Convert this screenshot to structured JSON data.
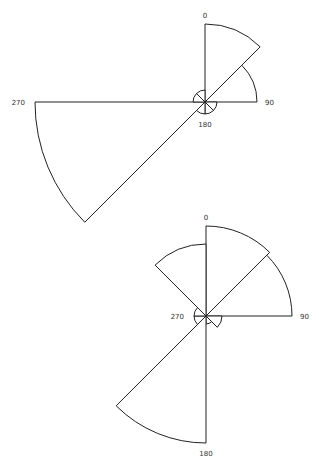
{
  "chart_data": [
    {
      "type": "polar-bar",
      "title": "",
      "center": [
        205,
        102
      ],
      "angle_labels": [
        "0",
        "90",
        "180",
        "270"
      ],
      "sectors": [
        {
          "start": 0,
          "end": 45,
          "r": 78
        },
        {
          "start": 45,
          "end": 90,
          "r": 52
        },
        {
          "start": 90,
          "end": 135,
          "r": 12
        },
        {
          "start": 135,
          "end": 180,
          "r": 12
        },
        {
          "start": 180,
          "end": 225,
          "r": 12
        },
        {
          "start": 225,
          "end": 270,
          "r": 170
        },
        {
          "start": 270,
          "end": 315,
          "r": 12
        },
        {
          "start": 315,
          "end": 360,
          "r": 12
        }
      ]
    },
    {
      "type": "polar-bar",
      "title": "",
      "center": [
        206,
        316
      ],
      "angle_labels": [
        "0",
        "90",
        "180",
        "270"
      ],
      "sectors": [
        {
          "start": 0,
          "end": 45,
          "r": 90
        },
        {
          "start": 45,
          "end": 90,
          "r": 86
        },
        {
          "start": 90,
          "end": 135,
          "r": 16
        },
        {
          "start": 135,
          "end": 180,
          "r": 8
        },
        {
          "start": 180,
          "end": 225,
          "r": 127
        },
        {
          "start": 225,
          "end": 270,
          "r": 12
        },
        {
          "start": 270,
          "end": 315,
          "r": 12
        },
        {
          "start": 315,
          "end": 360,
          "r": 72
        }
      ]
    }
  ]
}
